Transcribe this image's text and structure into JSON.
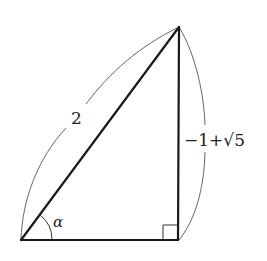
{
  "diagram": {
    "type": "right-triangle",
    "vertices": {
      "bottom_left": {
        "x": 21,
        "y": 240
      },
      "bottom_right": {
        "x": 178,
        "y": 240
      },
      "top": {
        "x": 179,
        "y": 27
      }
    },
    "labels": {
      "hypotenuse": "2",
      "vertical_side": "−1+√5",
      "vertical_side_parts": {
        "minus_one": "−1",
        "plus": "+",
        "sqrt_symbol": "√",
        "radicand": "5"
      },
      "angle": "α"
    },
    "right_angle_marker": {
      "corner": "bottom_right",
      "size": 15
    },
    "colors": {
      "edges": "#1a1a1a",
      "arcs": "#555555",
      "text": "#222222",
      "background": "#ffffff"
    }
  }
}
